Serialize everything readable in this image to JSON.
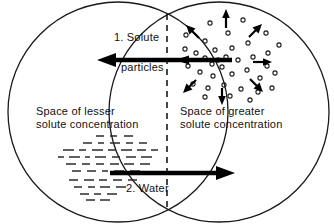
{
  "diagram": {
    "colors": {
      "outline": "#1a1a1a",
      "membrane": "#1a1a1a",
      "arrow": "#000000",
      "particle": "#1a1a1a",
      "water": "#2b2b2b",
      "text": "#111111",
      "background": "#ffffff"
    },
    "labels": {
      "solute_arrow": "1. Solute",
      "solute_arrow_second_line": "particles",
      "water_arrow": "2. Water",
      "left_space_line1": "Space of lesser",
      "left_space_line2": "solute concentration",
      "right_space_line1": "Space of greater",
      "right_space_line2": "solute concentration"
    },
    "icons": {
      "solute_particle": "open-circle-icon",
      "water_molecule": "dash-icon",
      "membrane": "dashed-vertical-line-icon",
      "solute_flow": "left-arrow-icon",
      "water_flow": "right-arrow-icon",
      "diffusion_radial": "radiating-arrows-icon"
    },
    "compartments": [
      {
        "name": "left-compartment",
        "concentration": "lesser",
        "contents": "water molecules",
        "circle": {
          "cx": 118,
          "cy": 112,
          "r": 111
        }
      },
      {
        "name": "right-compartment",
        "concentration": "greater",
        "contents": "solute particles",
        "circle": {
          "cx": 219,
          "cy": 112,
          "r": 111
        }
      }
    ],
    "membrane_line": {
      "x": 167,
      "y_top": 14,
      "y_bottom": 208
    },
    "flows": [
      {
        "id": 1,
        "name": "solute-particles-flow",
        "direction": "left",
        "label": "1. Solute particles",
        "from_x": 232,
        "to_x": 100,
        "y": 60
      },
      {
        "id": 2,
        "name": "water-flow",
        "direction": "right",
        "label": "2. Water",
        "from_x": 110,
        "to_x": 232,
        "y": 173
      }
    ],
    "radial_arrows": [
      {
        "name": "arrow-up",
        "angle": 270
      },
      {
        "name": "arrow-up-right",
        "angle": 315
      },
      {
        "name": "arrow-right",
        "angle": 0
      },
      {
        "name": "arrow-down-right",
        "angle": 45
      },
      {
        "name": "arrow-down",
        "angle": 90
      },
      {
        "name": "arrow-down-left",
        "angle": 135
      },
      {
        "name": "arrow-left",
        "angle": 180
      },
      {
        "name": "arrow-up-left",
        "angle": 225
      }
    ]
  }
}
